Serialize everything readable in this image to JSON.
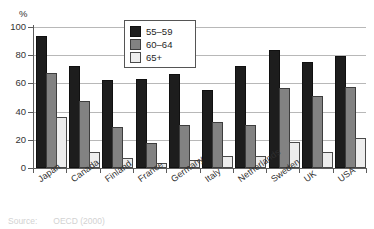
{
  "chart_data": {
    "type": "bar",
    "title": "",
    "subtitle": "",
    "xlabel": "",
    "ylabel": "%",
    "ylim": [
      0,
      100
    ],
    "yticks": [
      0,
      20,
      40,
      60,
      80,
      100
    ],
    "grid": true,
    "legend_position": "top-center",
    "categories": [
      "Japan",
      "Canada",
      "Finland",
      "France",
      "Germany",
      "Italy",
      "Netherlands",
      "Sweden",
      "UK",
      "USA"
    ],
    "series": [
      {
        "name": "55–59",
        "color": "#1d1d1d",
        "values": [
          92,
          71,
          61,
          62,
          65,
          54,
          71,
          82,
          74,
          78
        ]
      },
      {
        "name": "60–64",
        "color": "#828282",
        "values": [
          66,
          46,
          28,
          16,
          29,
          31,
          29,
          55,
          50,
          56
        ]
      },
      {
        "name": "65+",
        "color": "#ededed",
        "values": [
          35,
          10,
          6,
          2,
          4,
          7,
          7,
          17,
          10,
          20
        ]
      }
    ]
  },
  "axis": {
    "percent_symbol": "%",
    "tick_labels": [
      "100",
      "80",
      "60",
      "40",
      "20",
      "0"
    ]
  },
  "legend": {
    "entries": [
      {
        "label": "55–59",
        "swatch": "black-swatch"
      },
      {
        "label": "60–64",
        "swatch": "gray-swatch"
      },
      {
        "label": "65+",
        "swatch": "white-swatch"
      }
    ]
  },
  "footer": {
    "source_label": "Source:",
    "source_text": "OECD (2000)"
  }
}
